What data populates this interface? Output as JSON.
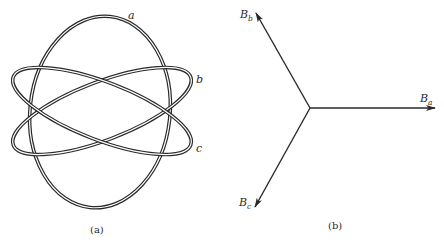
{
  "panels": [
    {
      "id": "a",
      "caption": "(a)",
      "description": "Three interlocking elliptical coils drawn as double lines",
      "coils": [
        {
          "label": "a",
          "cx": 100,
          "cy": 112,
          "rx": 70,
          "ry": 96,
          "rotation": 6
        },
        {
          "label": "b",
          "cx": 102,
          "cy": 111,
          "rx": 95,
          "ry": 29,
          "rotation": -21
        },
        {
          "label": "c",
          "cx": 102,
          "cy": 111,
          "rx": 95,
          "ry": 29,
          "rotation": 21
        }
      ]
    },
    {
      "id": "b",
      "caption": "(b)",
      "description": "Three phasor vectors 120 degrees apart from a common origin",
      "origin": {
        "x": 310,
        "y": 108
      },
      "vectors": [
        {
          "name": "B",
          "subscript": "a",
          "tip": {
            "x": 435,
            "y": 108
          }
        },
        {
          "name": "B",
          "subscript": "b",
          "tip": {
            "x": 256,
            "y": 13
          }
        },
        {
          "name": "B",
          "subscript": "c",
          "tip": {
            "x": 255,
            "y": 207
          }
        }
      ]
    }
  ],
  "colors": {
    "stroke": "#2a2a2a",
    "background": "#ffffff"
  }
}
